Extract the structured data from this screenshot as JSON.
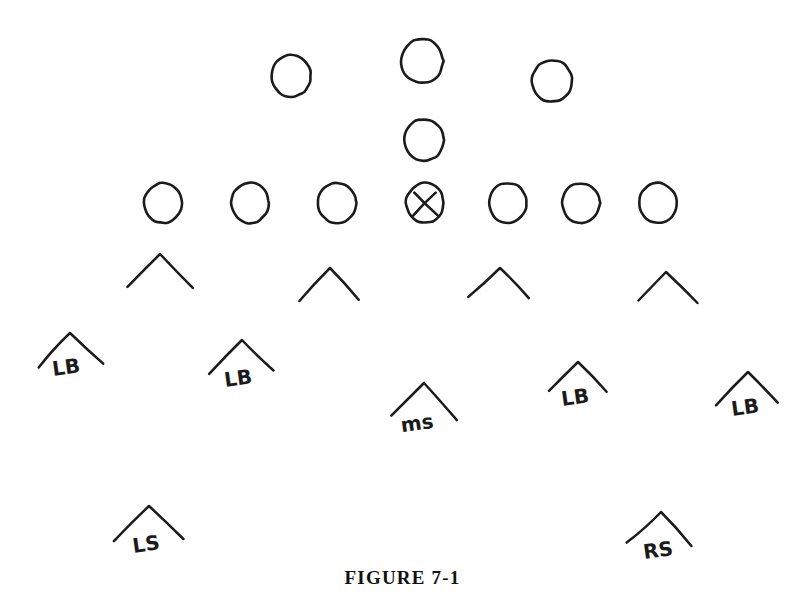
{
  "figure": {
    "caption": "FIGURE 7-1",
    "background_color": "#ffffff",
    "ink_color": "#1b1b1b",
    "width": 805,
    "height": 607
  },
  "diagram": {
    "type": "football-formation-diagram",
    "offense": {
      "line_label": "offensive-line",
      "players": [
        {
          "name": "ol-far-left",
          "shape": "circle",
          "cx": 163,
          "cy": 203,
          "r": 19,
          "marked": false,
          "label": ""
        },
        {
          "name": "ol-left",
          "shape": "circle",
          "cx": 250,
          "cy": 203,
          "r": 19,
          "marked": false,
          "label": ""
        },
        {
          "name": "ol-left-guard",
          "shape": "circle",
          "cx": 337,
          "cy": 203,
          "r": 19,
          "marked": false,
          "label": ""
        },
        {
          "name": "center-ball",
          "shape": "circle",
          "cx": 425,
          "cy": 203,
          "r": 19,
          "marked": true,
          "label": ""
        },
        {
          "name": "ol-right-guard",
          "shape": "circle",
          "cx": 508,
          "cy": 203,
          "r": 19,
          "marked": false,
          "label": ""
        },
        {
          "name": "ol-right",
          "shape": "circle",
          "cx": 581,
          "cy": 203,
          "r": 19,
          "marked": false,
          "label": ""
        },
        {
          "name": "ol-far-right",
          "shape": "circle",
          "cx": 658,
          "cy": 203,
          "r": 19,
          "marked": false,
          "label": ""
        }
      ],
      "backfield": [
        {
          "name": "back-left",
          "shape": "circle",
          "cx": 291,
          "cy": 76,
          "r": 20,
          "marked": false,
          "label": ""
        },
        {
          "name": "back-center",
          "shape": "circle",
          "cx": 422,
          "cy": 61,
          "r": 21,
          "marked": false,
          "label": ""
        },
        {
          "name": "back-right",
          "shape": "circle",
          "cx": 552,
          "cy": 81,
          "r": 20,
          "marked": false,
          "label": ""
        },
        {
          "name": "quarterback",
          "shape": "circle",
          "cx": 424,
          "cy": 140,
          "r": 20,
          "marked": false,
          "label": ""
        }
      ]
    },
    "defense": {
      "line": [
        {
          "name": "dl-1",
          "shape": "chevron",
          "apex_x": 160,
          "apex_y": 254,
          "half_w": 33,
          "drop": 34,
          "label": ""
        },
        {
          "name": "dl-2",
          "shape": "chevron",
          "apex_x": 330,
          "apex_y": 268,
          "half_w": 31,
          "drop": 31,
          "label": ""
        },
        {
          "name": "dl-3",
          "shape": "chevron",
          "apex_x": 500,
          "apex_y": 268,
          "half_w": 31,
          "drop": 31,
          "label": ""
        },
        {
          "name": "dl-4",
          "shape": "chevron",
          "apex_x": 666,
          "apex_y": 272,
          "half_w": 30,
          "drop": 30,
          "label": ""
        }
      ],
      "linebackers": [
        {
          "name": "lb-far-left",
          "shape": "chevron",
          "apex_x": 70,
          "apex_y": 333,
          "half_w": 32,
          "drop": 33,
          "label": "LB",
          "label_x": 67,
          "label_y": 374,
          "rotate": -8
        },
        {
          "name": "lb-left",
          "shape": "chevron",
          "apex_x": 242,
          "apex_y": 340,
          "half_w": 32,
          "drop": 33,
          "label": "LB",
          "label_x": 239,
          "label_y": 385,
          "rotate": -8
        },
        {
          "name": "lb-right",
          "shape": "chevron",
          "apex_x": 578,
          "apex_y": 362,
          "half_w": 30,
          "drop": 31,
          "label": "LB",
          "label_x": 576,
          "label_y": 404,
          "rotate": -8
        },
        {
          "name": "lb-far-right",
          "shape": "chevron",
          "apex_x": 748,
          "apex_y": 372,
          "half_w": 30,
          "drop": 32,
          "label": "LB",
          "label_x": 746,
          "label_y": 414,
          "rotate": -8
        }
      ],
      "safeties": [
        {
          "name": "middle-safety",
          "shape": "chevron",
          "apex_x": 424,
          "apex_y": 383,
          "half_w": 33,
          "drop": 35,
          "label": "ms",
          "label_x": 418,
          "label_y": 430,
          "rotate": -8
        },
        {
          "name": "left-safety",
          "shape": "chevron",
          "apex_x": 149,
          "apex_y": 506,
          "half_w": 33,
          "drop": 33,
          "label": "LS",
          "label_x": 147,
          "label_y": 551,
          "rotate": -8
        },
        {
          "name": "right-safety",
          "shape": "chevron",
          "apex_x": 661,
          "apex_y": 512,
          "half_w": 32,
          "drop": 33,
          "label": "RS",
          "label_x": 659,
          "label_y": 557,
          "rotate": -8
        }
      ]
    }
  }
}
